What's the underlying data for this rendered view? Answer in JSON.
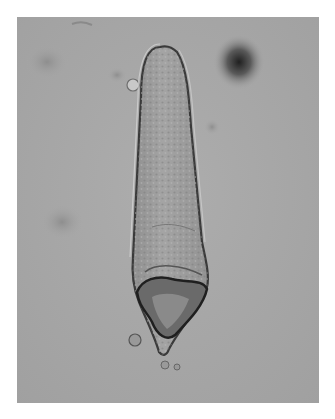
{
  "image": {
    "subject": "microscopy image of elongated spindle-shaped cell (spore/conidium)",
    "background_color": "#a9a9a9",
    "cell_fill_color": "#9c9c9c",
    "outline_color": "#3a3a3a"
  }
}
